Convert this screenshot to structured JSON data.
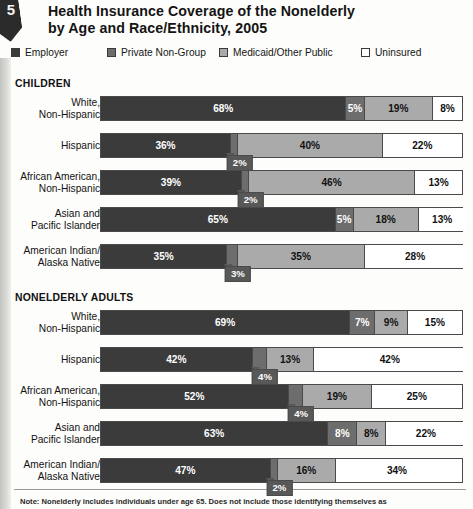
{
  "corner": {
    "number": "5"
  },
  "header": {
    "title_line1": "Health Insurance Coverage of the Nonelderly",
    "title_line2": "by Age and Race/Ethnicity, 2005"
  },
  "legend": {
    "items": [
      {
        "label": "Employer",
        "color": "#3b3b3b",
        "key": "employer"
      },
      {
        "label": "Private Non-Group",
        "color": "#6d6d6d",
        "key": "private"
      },
      {
        "label": "Medicaid/Other Public",
        "color": "#aaaaaa",
        "key": "medicaid"
      },
      {
        "label": "Uninsured",
        "color": "#ffffff",
        "key": "uninsured"
      }
    ]
  },
  "sections": [
    {
      "heading": "CHILDREN"
    },
    {
      "heading": "NONELDERLY ADULTS"
    }
  ],
  "footnote": {
    "text": "Note: Nonelderly includes individuals under age 65. Does not include those identifying themselves as"
  },
  "chart_data": {
    "type": "bar",
    "orientation": "horizontal",
    "stacked": true,
    "normalized_percent": true,
    "title": "Health Insurance Coverage of the Nonelderly by Age and Race/Ethnicity, 2005",
    "xlabel": "",
    "ylabel": "",
    "xlim": [
      0,
      100
    ],
    "grid": false,
    "legend_position": "top",
    "value_suffix": "%",
    "series": [
      {
        "name": "Employer",
        "color": "#3b3b3b"
      },
      {
        "name": "Private Non-Group",
        "color": "#6d6d6d"
      },
      {
        "name": "Medicaid/Other Public",
        "color": "#aaaaaa"
      },
      {
        "name": "Uninsured",
        "color": "#ffffff"
      }
    ],
    "groups": [
      {
        "heading": "CHILDREN",
        "rows": [
          {
            "category_lines": [
              "White,",
              "Non-Hispanic"
            ],
            "segments": [
              {
                "series": "Employer",
                "value": 68,
                "label": "68%",
                "callout": false
              },
              {
                "series": "Private Non-Group",
                "value": 5,
                "label": "5%",
                "callout": false
              },
              {
                "series": "Medicaid/Other Public",
                "value": 19,
                "label": "19%",
                "callout": false
              },
              {
                "series": "Uninsured",
                "value": 8,
                "label": "8%",
                "callout": false
              }
            ]
          },
          {
            "category_lines": [
              "Hispanic"
            ],
            "segments": [
              {
                "series": "Employer",
                "value": 36,
                "label": "36%",
                "callout": false
              },
              {
                "series": "Private Non-Group",
                "value": 2,
                "label": "2%",
                "callout": true
              },
              {
                "series": "Medicaid/Other Public",
                "value": 40,
                "label": "40%",
                "callout": false
              },
              {
                "series": "Uninsured",
                "value": 22,
                "label": "22%",
                "callout": false
              }
            ]
          },
          {
            "category_lines": [
              "African American,",
              "Non-Hispanic"
            ],
            "segments": [
              {
                "series": "Employer",
                "value": 39,
                "label": "39%",
                "callout": false
              },
              {
                "series": "Private Non-Group",
                "value": 2,
                "label": "2%",
                "callout": true
              },
              {
                "series": "Medicaid/Other Public",
                "value": 46,
                "label": "46%",
                "callout": false
              },
              {
                "series": "Uninsured",
                "value": 13,
                "label": "13%",
                "callout": false
              }
            ]
          },
          {
            "category_lines": [
              "Asian and",
              "Pacific Islander"
            ],
            "segments": [
              {
                "series": "Employer",
                "value": 65,
                "label": "65%",
                "callout": false
              },
              {
                "series": "Private Non-Group",
                "value": 5,
                "label": "5%",
                "callout": false
              },
              {
                "series": "Medicaid/Other Public",
                "value": 18,
                "label": "18%",
                "callout": false
              },
              {
                "series": "Uninsured",
                "value": 13,
                "label": "13%",
                "callout": false
              }
            ]
          },
          {
            "category_lines": [
              "American Indian/",
              "Alaska Native"
            ],
            "segments": [
              {
                "series": "Employer",
                "value": 35,
                "label": "35%",
                "callout": false
              },
              {
                "series": "Private Non-Group",
                "value": 3,
                "label": "3%",
                "callout": true
              },
              {
                "series": "Medicaid/Other Public",
                "value": 35,
                "label": "35%",
                "callout": false
              },
              {
                "series": "Uninsured",
                "value": 28,
                "label": "28%",
                "callout": false
              }
            ]
          }
        ]
      },
      {
        "heading": "NONELDERLY ADULTS",
        "rows": [
          {
            "category_lines": [
              "White,",
              "Non-Hispanic"
            ],
            "segments": [
              {
                "series": "Employer",
                "value": 69,
                "label": "69%",
                "callout": false
              },
              {
                "series": "Private Non-Group",
                "value": 7,
                "label": "7%",
                "callout": false
              },
              {
                "series": "Medicaid/Other Public",
                "value": 9,
                "label": "9%",
                "callout": false
              },
              {
                "series": "Uninsured",
                "value": 15,
                "label": "15%",
                "callout": false
              }
            ]
          },
          {
            "category_lines": [
              "Hispanic"
            ],
            "segments": [
              {
                "series": "Employer",
                "value": 42,
                "label": "42%",
                "callout": false
              },
              {
                "series": "Private Non-Group",
                "value": 4,
                "label": "4%",
                "callout": true
              },
              {
                "series": "Medicaid/Other Public",
                "value": 13,
                "label": "13%",
                "callout": false
              },
              {
                "series": "Uninsured",
                "value": 42,
                "label": "42%",
                "callout": false
              }
            ]
          },
          {
            "category_lines": [
              "African American,",
              "Non-Hispanic"
            ],
            "segments": [
              {
                "series": "Employer",
                "value": 52,
                "label": "52%",
                "callout": false
              },
              {
                "series": "Private Non-Group",
                "value": 4,
                "label": "4%",
                "callout": true
              },
              {
                "series": "Medicaid/Other Public",
                "value": 19,
                "label": "19%",
                "callout": false
              },
              {
                "series": "Uninsured",
                "value": 25,
                "label": "25%",
                "callout": false
              }
            ]
          },
          {
            "category_lines": [
              "Asian and",
              "Pacific Islander"
            ],
            "segments": [
              {
                "series": "Employer",
                "value": 63,
                "label": "63%",
                "callout": false
              },
              {
                "series": "Private Non-Group",
                "value": 8,
                "label": "8%",
                "callout": false
              },
              {
                "series": "Medicaid/Other Public",
                "value": 8,
                "label": "8%",
                "callout": false
              },
              {
                "series": "Uninsured",
                "value": 22,
                "label": "22%",
                "callout": false
              }
            ]
          },
          {
            "category_lines": [
              "American Indian/",
              "Alaska Native"
            ],
            "segments": [
              {
                "series": "Employer",
                "value": 47,
                "label": "47%",
                "callout": false
              },
              {
                "series": "Private Non-Group",
                "value": 2,
                "label": "2%",
                "callout": true
              },
              {
                "series": "Medicaid/Other Public",
                "value": 16,
                "label": "16%",
                "callout": false
              },
              {
                "series": "Uninsured",
                "value": 34,
                "label": "34%",
                "callout": false
              }
            ]
          }
        ]
      }
    ]
  }
}
